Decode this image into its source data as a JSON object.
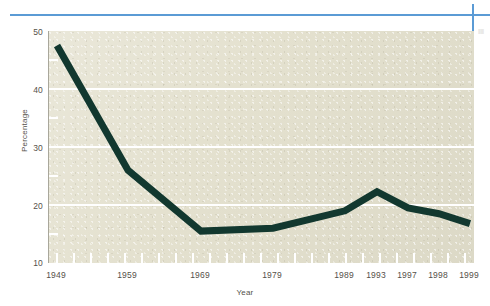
{
  "chart_data": {
    "type": "line",
    "title": "",
    "xlabel": "Year",
    "ylabel": "Percentage",
    "categories": [
      "1949",
      "1959",
      "1969",
      "1979",
      "1989",
      "1993",
      "1997",
      "1998",
      "1999"
    ],
    "values": [
      47.5,
      26.0,
      15.5,
      16.0,
      19.0,
      22.3,
      19.5,
      18.5,
      16.8
    ],
    "series": [
      {
        "name": "Percentage",
        "values": [
          47.5,
          26.0,
          15.5,
          16.0,
          19.0,
          22.3,
          19.5,
          18.5,
          16.8
        ],
        "color": "#12382f"
      }
    ],
    "ylim": [
      10,
      50
    ],
    "yticks": [
      10,
      20,
      30,
      40,
      50
    ],
    "ytick_labels": [
      "10",
      "20",
      "30",
      "40",
      "50"
    ],
    "xtick_labels": [
      "1949",
      "1959",
      "1969",
      "1979",
      "1989",
      "1993",
      "1997",
      "1998",
      "1999"
    ],
    "grid": "horizontal",
    "gridline_color": "#ffffff",
    "legend": "none",
    "plot_background": "#e4e1cf",
    "minor_ticks": "annual"
  },
  "decorations": {
    "rule_color": "#5b9bd5",
    "margin_text": "|||||||"
  }
}
